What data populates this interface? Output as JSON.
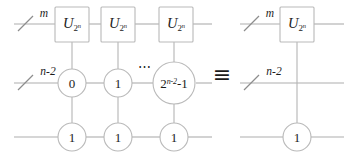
{
  "figure": {
    "type": "quantum-circuit-identity",
    "equivalence_symbol": "≡",
    "ellipsis": "⋯",
    "colors": {
      "wire": "#aeaeae",
      "outline": "#b9b9b9",
      "text": "#1b1b1b",
      "background": "#ffffff"
    }
  },
  "left_circuit": {
    "wires": [
      {
        "name": "top",
        "count_label": "m",
        "has_slash": true
      },
      {
        "name": "middle",
        "count_label": "n-2",
        "has_slash": true
      },
      {
        "name": "bottom",
        "count_label": "",
        "has_slash": false
      }
    ],
    "gates": [
      {
        "symbol": "U",
        "subscript_base": "2",
        "subscript_exponent": "n"
      },
      {
        "symbol": "U",
        "subscript_base": "2",
        "subscript_exponent": "n"
      },
      {
        "symbol": "U",
        "subscript_base": "2",
        "subscript_exponent": "n"
      }
    ],
    "middle_controls": [
      {
        "label": "0",
        "exponent": ""
      },
      {
        "label": "1",
        "exponent": ""
      },
      {
        "label": "2",
        "exponent": "n-2",
        "suffix": "-1",
        "big": true
      }
    ],
    "bottom_controls": [
      {
        "label": "1"
      },
      {
        "label": "1"
      },
      {
        "label": "1"
      }
    ]
  },
  "right_circuit": {
    "wires": [
      {
        "name": "top",
        "count_label": "m",
        "has_slash": true
      },
      {
        "name": "middle",
        "count_label": "n-2",
        "has_slash": true
      },
      {
        "name": "bottom",
        "count_label": "",
        "has_slash": false
      }
    ],
    "gates": [
      {
        "symbol": "U",
        "subscript_base": "2",
        "subscript_exponent": "n"
      }
    ],
    "bottom_controls": [
      {
        "label": "1"
      }
    ]
  }
}
